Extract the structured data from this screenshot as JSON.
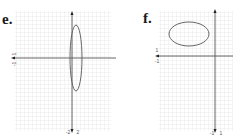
{
  "panels": [
    {
      "label": "e.",
      "grid": {
        "x": 15,
        "y": 11,
        "width": 96,
        "height": 120,
        "step": 4,
        "color": "#d9d9d9"
      },
      "axes": {
        "x_axis_y": 58,
        "x_axis_from": 11,
        "x_axis_to": 116,
        "y_axis_x": 72,
        "y_axis_from": 11,
        "y_axis_to": 133,
        "color": "#555555"
      },
      "ellipse": {
        "cx": 76,
        "cy": 58,
        "rx": 6,
        "ry": 33,
        "stroke": "#666666"
      },
      "tick_labels": {
        "y_pos": "1",
        "y_neg": "-1",
        "x_neg": "-2",
        "x_pos": "2"
      }
    },
    {
      "label": "f.",
      "grid": {
        "x": 159,
        "y": 11,
        "width": 74,
        "height": 120,
        "step": 4,
        "color": "#d9d9d9"
      },
      "axes": {
        "x_axis_y": 56,
        "x_axis_from": 155,
        "x_axis_to": 233,
        "y_axis_x": 215,
        "y_axis_from": 9,
        "y_axis_to": 133,
        "color": "#555555"
      },
      "ellipse": {
        "cx": 189,
        "cy": 34,
        "rx": 20,
        "ry": 12,
        "stroke": "#666666"
      },
      "tick_labels": {
        "y_pos": "1",
        "y_neg": "-1",
        "x_neg": "-1",
        "x_pos": "1"
      }
    }
  ]
}
